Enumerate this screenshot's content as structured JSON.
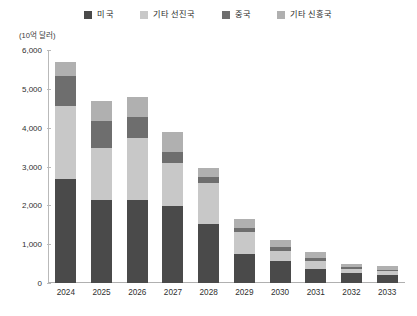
{
  "chart_data": {
    "type": "bar",
    "stacked": true,
    "title": "",
    "subtitle": "",
    "unit_label": "(10억 달러)",
    "xlabel": "",
    "ylabel": "",
    "categories": [
      "2024",
      "2025",
      "2026",
      "2027",
      "2028",
      "2029",
      "2030",
      "2031",
      "2032",
      "2033"
    ],
    "ylim": [
      0,
      6000
    ],
    "yticks": [
      0,
      1000,
      2000,
      3000,
      4000,
      5000,
      6000
    ],
    "ytick_labels": [
      "0",
      "1,000",
      "2,000",
      "3,000",
      "4,000",
      "5,000",
      "6,000"
    ],
    "grid": false,
    "legend_position": "top",
    "series": [
      {
        "name": "미국",
        "color": "#4a4a4a",
        "values": [
          2680,
          2130,
          2130,
          1980,
          1520,
          760,
          560,
          360,
          260,
          200
        ]
      },
      {
        "name": "기타 선진국",
        "color": "#c8c8c8",
        "values": [
          1880,
          1350,
          1600,
          1100,
          1050,
          560,
          260,
          200,
          110,
          110
        ]
      },
      {
        "name": "중국",
        "color": "#6e6e6e",
        "values": [
          760,
          700,
          540,
          300,
          170,
          110,
          110,
          80,
          30,
          30
        ]
      },
      {
        "name": "기타 신흥국",
        "color": "#b0b0b0",
        "values": [
          380,
          500,
          510,
          500,
          230,
          230,
          180,
          160,
          90,
          90
        ]
      }
    ],
    "totals": [
      5700,
      4680,
      4780,
      3880,
      2970,
      1660,
      1110,
      800,
      490,
      430
    ]
  }
}
